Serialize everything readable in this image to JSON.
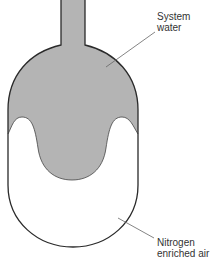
{
  "diagram": {
    "labels": {
      "system_water_line1": "System",
      "system_water_line2": "water",
      "nitrogen_line1": "Nitrogen",
      "nitrogen_line2": "enriched air"
    },
    "colors": {
      "water_fill": "#b4b4b4",
      "outline": "#2a2a2a",
      "air_fill": "#ffffff",
      "leader": "#666666",
      "text": "#333333"
    }
  }
}
